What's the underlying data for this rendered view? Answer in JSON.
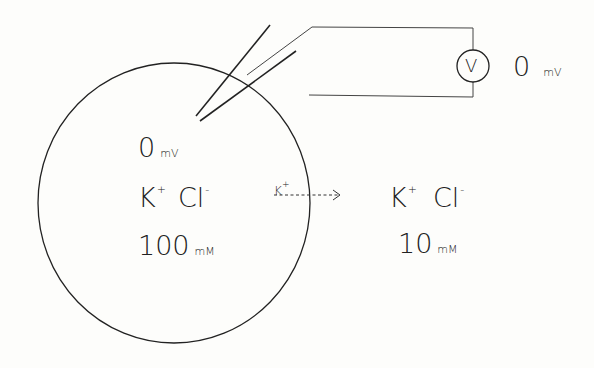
{
  "diagram": {
    "title": "",
    "cell": {
      "potential_value": "0",
      "potential_unit": "mV",
      "ions": [
        {
          "symbol": "K",
          "charge": "+"
        },
        {
          "symbol": "Cl",
          "charge": "-"
        }
      ],
      "concentration_value": "100",
      "concentration_unit": "mM"
    },
    "flux": {
      "ion_symbol": "K",
      "ion_charge": "+",
      "direction": "outward"
    },
    "outside": {
      "ions": [
        {
          "symbol": "K",
          "charge": "+"
        },
        {
          "symbol": "Cl",
          "charge": "-"
        }
      ],
      "concentration_value": "10",
      "concentration_unit": "mM"
    },
    "voltmeter": {
      "symbol": "V",
      "reading_value": "0",
      "reading_unit": "mV"
    },
    "colors": {
      "line": "#222222",
      "background": "#fdfdfb"
    }
  }
}
